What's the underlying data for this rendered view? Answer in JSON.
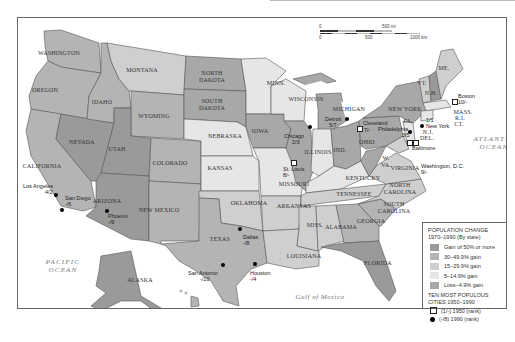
{
  "colors": {
    "gain50": "#9a9a9a",
    "gain30": "#b4b4b4",
    "gain15": "#cfcfcf",
    "gain5": "#e6e6e6",
    "loss": "#a8a8a8",
    "water": "#ffffff",
    "border": "#555555"
  },
  "scale": {
    "mi_zero": "0",
    "mi_max": "500 mi",
    "km_zero": "0",
    "km_mid": "500",
    "km_max": "1000 km"
  },
  "oceans": {
    "pacific": "PACIFIC\nOCEAN",
    "pacific_line1": "PACIFIC",
    "pacific_line2": "OCEAN",
    "atlantic_line1": "ATLANTIC",
    "atlantic_line2": "OCEAN",
    "gulf": "Gulf of Mexico"
  },
  "states": [
    {
      "name": "WASHINGTON",
      "category": "30-49.9% gain"
    },
    {
      "name": "OREGON",
      "category": "30-49.9% gain"
    },
    {
      "name": "CALIFORNIA",
      "category": "30-49.9% gain"
    },
    {
      "name": "NEVADA",
      "category": "Gain of 50% or more"
    },
    {
      "name": "IDAHO",
      "category": "30-49.9% gain"
    },
    {
      "name": "MONTANA",
      "category": "15-29.9% gain"
    },
    {
      "name": "WYOMING",
      "category": "30-49.9% gain"
    },
    {
      "name": "UTAH",
      "category": "Gain of 50% or more"
    },
    {
      "name": "COLORADO",
      "category": "30-49.9% gain"
    },
    {
      "name": "ARIZONA",
      "category": "Gain of 50% or more"
    },
    {
      "name": "NEW MEXICO",
      "category": "30-49.9% gain"
    },
    {
      "name": "NORTH DAKOTA",
      "category": "Loss-4.9% gain"
    },
    {
      "name": "SOUTH DAKOTA",
      "category": "Loss-4.9% gain"
    },
    {
      "name": "NEBRASKA",
      "category": "5-14.9% gain"
    },
    {
      "name": "KANSAS",
      "category": "5-14.9% gain"
    },
    {
      "name": "OKLAHOMA",
      "category": "15-29.9% gain"
    },
    {
      "name": "TEXAS",
      "category": "30-49.9% gain"
    },
    {
      "name": "MINN.",
      "category": "5-14.9% gain"
    },
    {
      "name": "IOWA",
      "category": "Loss-4.9% gain"
    },
    {
      "name": "MISSOURI",
      "category": "5-14.9% gain"
    },
    {
      "name": "ARKANSAS",
      "category": "15-29.9% gain"
    },
    {
      "name": "LOUISIANA",
      "category": "15-29.9% gain"
    },
    {
      "name": "WISCONSIN",
      "category": "5-14.9% gain"
    },
    {
      "name": "ILLINOIS",
      "category": "Loss-4.9% gain"
    },
    {
      "name": "MICHIGAN",
      "category": "Loss-4.9% gain"
    },
    {
      "name": "IND.",
      "category": "5-14.9% gain"
    },
    {
      "name": "OHIO",
      "category": "Loss-4.9% gain"
    },
    {
      "name": "KENTUCKY",
      "category": "5-14.9% gain"
    },
    {
      "name": "TENNESSEE",
      "category": "15-29.9% gain"
    },
    {
      "name": "MISS.",
      "category": "15-29.9% gain"
    },
    {
      "name": "ALABAMA",
      "category": "15-29.9% gain"
    },
    {
      "name": "GEORGIA",
      "category": "30-49.9% gain"
    },
    {
      "name": "FLORIDA",
      "category": "Gain of 50% or more"
    },
    {
      "name": "SOUTH CAROLINA",
      "category": "30-49.9% gain"
    },
    {
      "name": "NORTH CAROLINA",
      "category": "15-29.9% gain"
    },
    {
      "name": "VIRGINIA",
      "category": "15-29.9% gain"
    },
    {
      "name": "W. VA.",
      "category": "Loss-4.9% gain"
    },
    {
      "name": "PA.",
      "category": "Loss-4.9% gain"
    },
    {
      "name": "NEW YORK",
      "category": "Loss-4.9% gain"
    },
    {
      "name": "VT.",
      "category": "15-29.9% gain"
    },
    {
      "name": "N.H.",
      "category": "Gain of 50% or more"
    },
    {
      "name": "ME.",
      "category": "15-29.9% gain"
    },
    {
      "name": "MASS.",
      "category": "5-14.9% gain"
    },
    {
      "name": "R.I.",
      "category": "5-14.9% gain"
    },
    {
      "name": "CT.",
      "category": "5-14.9% gain"
    },
    {
      "name": "N.J.",
      "category": "5-14.9% gain"
    },
    {
      "name": "DEL.",
      "category": "15-29.9% gain"
    },
    {
      "name": "MD.",
      "category": "15-29.9% gain"
    },
    {
      "name": "ALASKA",
      "category": "Gain of 50% or more"
    },
    {
      "name": "HAWAII",
      "category": "30-49.9% gain"
    }
  ],
  "cities": [
    {
      "name": "Los Angeles",
      "rank": "4/2"
    },
    {
      "name": "San Diego",
      "rank": "-/6"
    },
    {
      "name": "Phoenix",
      "rank": "-/9"
    },
    {
      "name": "San Antonio",
      "rank": "-/10"
    },
    {
      "name": "Houston",
      "rank": "-/4"
    },
    {
      "name": "Dallas",
      "rank": "-/8"
    },
    {
      "name": "St. Louis",
      "rank": "8/-"
    },
    {
      "name": "Chicago",
      "rank": "2/3"
    },
    {
      "name": "Detroit",
      "rank": "5/7"
    },
    {
      "name": "Cleveland",
      "rank": "7/-"
    },
    {
      "name": "Philadelphia",
      "rank": "3/5"
    },
    {
      "name": "New York",
      "rank": "1/1"
    },
    {
      "name": "Baltimore",
      "rank": "6/-"
    },
    {
      "name": "Washington, D.C.",
      "rank": "9/-"
    },
    {
      "name": "Boston",
      "rank": "10/-"
    }
  ],
  "legend": {
    "title_line1": "POPULATION CHANGE",
    "title_line2": "1970–1990 (By state)",
    "items": [
      {
        "label": "Gain of 50% or more",
        "color": "#9a9a9a"
      },
      {
        "label": "30–49.9% gain",
        "color": "#b4b4b4"
      },
      {
        "label": "15–29.9% gain",
        "color": "#cfcfcf"
      },
      {
        "label": "5–14.9% gain",
        "color": "#e6e6e6"
      },
      {
        "label": "Loss–4.9% gain",
        "color": "#a8a8a8"
      }
    ],
    "cities_title_line1": "TEN MOST POPULOUS",
    "cities_title_line2": "CITIES 1950–1990",
    "sym_1950": "(1/-) 1950 (rank)",
    "sym_1990": "(-/8) 1990 (rank)"
  }
}
